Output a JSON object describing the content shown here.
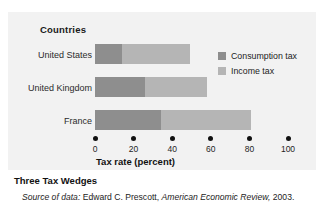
{
  "figure": {
    "countries_axis_title": "Countries",
    "caption_title": "Three Tax Wedges",
    "source": {
      "label": "Source of data:",
      "author": "Edward C. Prescott,",
      "publication": "American Economic Review,",
      "year": "2003."
    }
  },
  "legend": {
    "position": "inside-right",
    "items": [
      {
        "label": "Consumption tax",
        "color": "#8e8e8e",
        "swatch_name": "legend-swatch-consumption-tax"
      },
      {
        "label": "Income tax",
        "color": "#b5b5b5",
        "swatch_name": "legend-swatch-income-tax"
      }
    ]
  },
  "chart_data": {
    "type": "bar",
    "orientation": "horizontal",
    "stacked": true,
    "title": "Three Tax Wedges",
    "xlabel": "Tax rate (percent)",
    "ylabel": "Countries",
    "xlim": [
      0,
      100
    ],
    "xticks": [
      0,
      20,
      40,
      60,
      80,
      100
    ],
    "xtick_labels": [
      "0",
      "20",
      "40",
      "60",
      "80",
      "100"
    ],
    "tick_style": "dots",
    "grid": false,
    "categories": [
      "United States",
      "United Kingdom",
      "France"
    ],
    "series": [
      {
        "name": "Consumption tax",
        "color": "#8e8e8e",
        "values": [
          14,
          26,
          34
        ]
      },
      {
        "name": "Income tax",
        "color": "#b5b5b5",
        "values": [
          35,
          32,
          47
        ]
      }
    ],
    "totals": [
      49,
      58,
      81
    ]
  },
  "colors": {
    "panel_background": "#f2f2f2",
    "consumption_tax": "#8e8e8e",
    "income_tax": "#b5b5b5",
    "text": "#1a1a1a"
  }
}
